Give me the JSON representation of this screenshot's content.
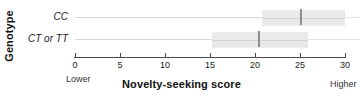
{
  "chart_data": {
    "type": "bar",
    "title": "",
    "xlabel": "Novelty-seeking score",
    "ylabel": "Genotype",
    "categories": [
      "CC",
      "CT or TT"
    ],
    "xlim": [
      0,
      30
    ],
    "xticks": [
      0,
      5,
      10,
      15,
      20,
      25,
      30
    ],
    "xtick_labels": [
      "0",
      "5",
      "10",
      "15",
      "20",
      "25",
      "30"
    ],
    "grid": false,
    "legend": "none",
    "axis_endpoint_labels": {
      "low": "Lower",
      "high": "Higher"
    },
    "series": [
      {
        "name": "CC",
        "box_low": 20.8,
        "box_high": 30.0,
        "median": 25.1,
        "whisker_low": 0.0,
        "whisker_high": 30.0
      },
      {
        "name": "CT or TT",
        "box_low": 15.2,
        "box_high": 25.9,
        "median": 20.4,
        "whisker_low": 0.0,
        "whisker_high": 25.9
      }
    ],
    "colors": {
      "box_fill": "#e9e9e9",
      "median_line": "#8d8d8d",
      "axis": "#4a4a4a",
      "row_rule": "#e3e3e3",
      "text": "#1a1a1a"
    }
  }
}
